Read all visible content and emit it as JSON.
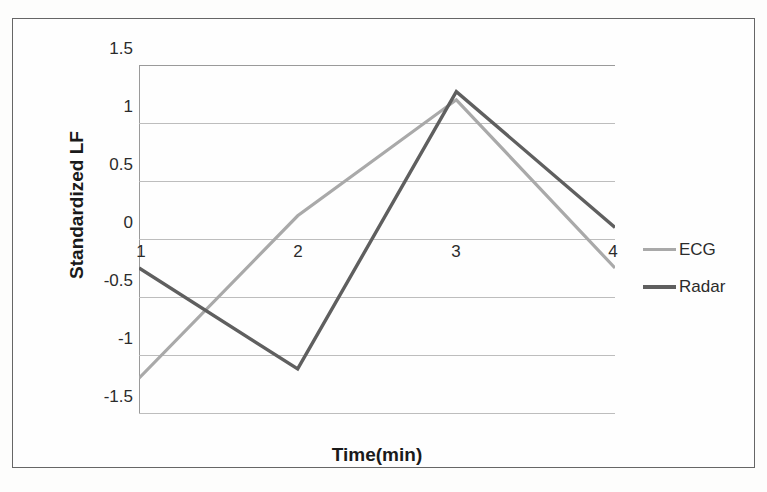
{
  "chart_data": {
    "type": "line",
    "title": "",
    "xlabel": "Time(min)",
    "ylabel": "Standardized LF",
    "x": [
      1,
      2,
      3,
      4
    ],
    "x_tick_labels": [
      "1",
      "2",
      "3",
      "4"
    ],
    "y_tick_labels": [
      "1.5",
      "1",
      "0.5",
      "0",
      "-0.5",
      "-1",
      "-1.5"
    ],
    "y_ticks": [
      1.5,
      1,
      0.5,
      0,
      -0.5,
      -1,
      -1.5
    ],
    "ylim": [
      -1.5,
      1.5
    ],
    "xlim": [
      1,
      4
    ],
    "grid": "horizontal",
    "legend_position": "right",
    "series": [
      {
        "name": "ECG",
        "color": "#a9a9a9",
        "values": [
          -1.2,
          0.2,
          1.2,
          -0.25
        ]
      },
      {
        "name": "Radar",
        "color": "#5f5f5f",
        "values": [
          -0.25,
          -1.12,
          1.27,
          0.1
        ]
      }
    ]
  },
  "axes": {
    "y_title": "Standardized LF",
    "x_title": "Time(min)",
    "y_labels": [
      "1.5",
      "1",
      "0.5",
      "0",
      "-0.5",
      "-1",
      "-1.5"
    ],
    "x_labels": [
      "1",
      "2",
      "3",
      "4"
    ]
  },
  "legend": {
    "entries": [
      {
        "label": "ECG",
        "color": "#a9a9a9"
      },
      {
        "label": "Radar",
        "color": "#5f5f5f"
      }
    ]
  },
  "colors": {
    "ecg": "#a9a9a9",
    "radar": "#5f5f5f",
    "gridline": "#bdbdbd",
    "axis": "#9a9a9a",
    "frame": "#666666",
    "text": "#2b2b2b",
    "background": "#fefefe"
  }
}
